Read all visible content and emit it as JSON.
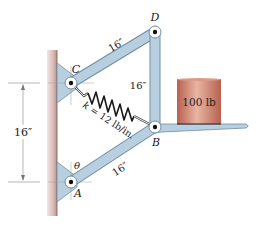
{
  "diagram": {
    "points": {
      "A": {
        "label": "A"
      },
      "B": {
        "label": "B"
      },
      "C": {
        "label": "C"
      },
      "D": {
        "label": "D"
      }
    },
    "members": {
      "CD": {
        "length": "16″"
      },
      "DB": {
        "length": "16″"
      },
      "AB": {
        "length": "16″"
      }
    },
    "spring": {
      "label": "k = 12 lb/in."
    },
    "weight": {
      "label": "100 lb"
    },
    "dimension": {
      "label": "16″"
    },
    "angle": {
      "label": "θ"
    },
    "colors": {
      "member_fill": "#b8cfe0",
      "member_stroke": "#6f8ea6",
      "wall": "#c9a9a6",
      "weight_body": "#c77a68",
      "weight_highlight": "#e8b7a6",
      "spring": "#1a1a1a"
    }
  }
}
